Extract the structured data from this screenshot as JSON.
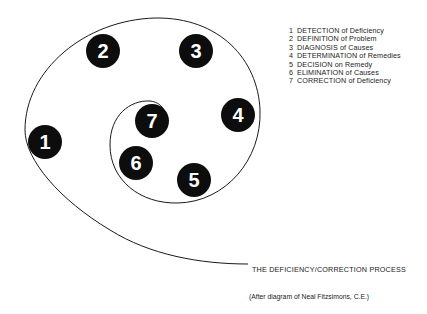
{
  "diagram": {
    "title": "THE DEFICIENCY/CORRECTION PROCESS",
    "credit": "(After diagram of Neal Fitzsimons, C.E.)",
    "nodes": [
      {
        "number": "1",
        "label": "DETECTION of Deficiency"
      },
      {
        "number": "2",
        "label": "DEFINITION of Problem"
      },
      {
        "number": "3",
        "label": "DIAGNOSIS of Causes"
      },
      {
        "number": "4",
        "label": "DETERMINATION of Remedies"
      },
      {
        "number": "5",
        "label": "DECISION on Remedy"
      },
      {
        "number": "6",
        "label": "ELIMINATION of Causes"
      },
      {
        "number": "7",
        "label": "CORRECTION of Deficiency"
      }
    ],
    "colors": {
      "node_fill": "#0d0d0d",
      "node_text": "#ffffff",
      "line": "#1a1a1a",
      "text": "#222222"
    }
  }
}
